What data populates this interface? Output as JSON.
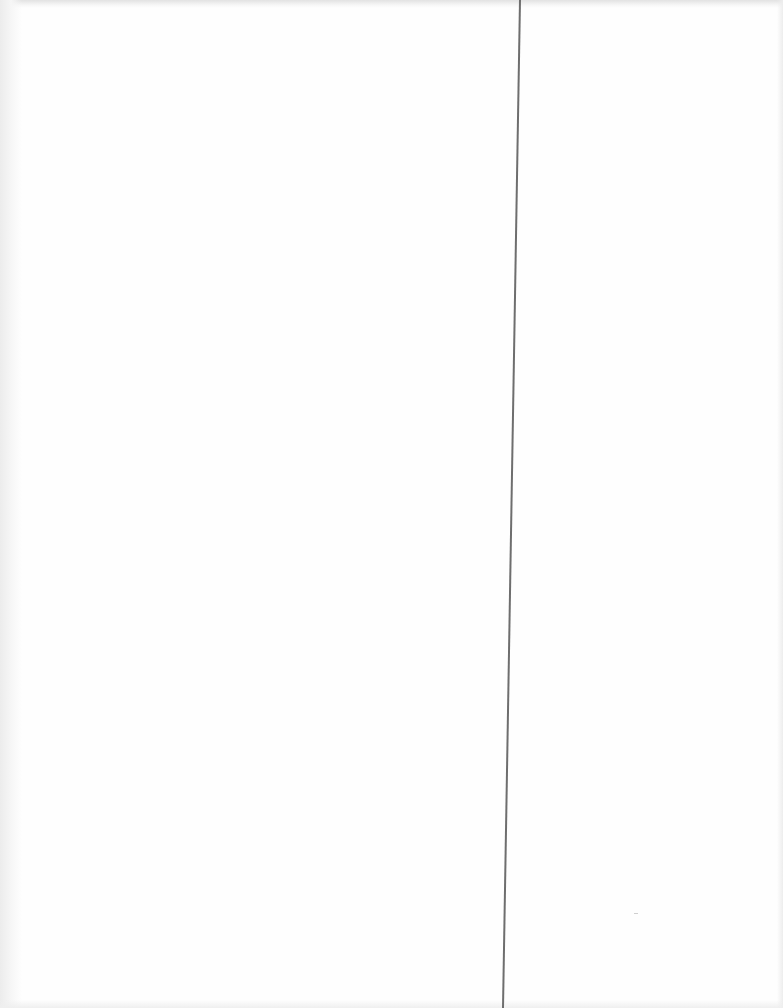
{
  "page": {
    "type": "scanned-blank-page",
    "background_color": "#fefefe",
    "divider": {
      "color": "#6e6e6e",
      "x_top": 520,
      "x_bottom": 503,
      "width_px": 2
    },
    "text_content": []
  }
}
